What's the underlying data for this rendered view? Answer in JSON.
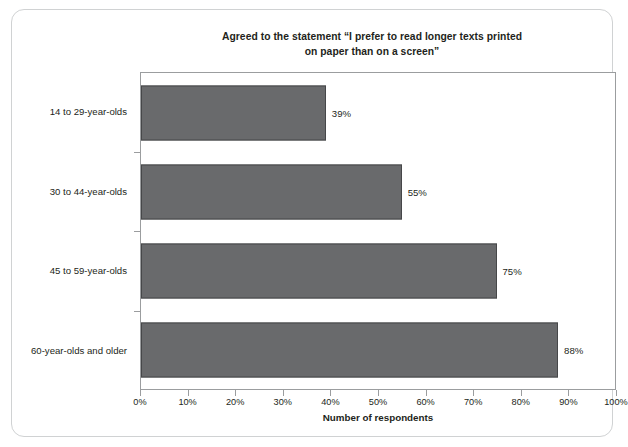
{
  "chart_data": {
    "type": "bar",
    "orientation": "horizontal",
    "title": "Agreed to the statement “I prefer to read longer texts printed on paper than on a screen”",
    "title_lines": [
      "Agreed to the statement “I prefer to read longer texts printed",
      "on paper than on a screen”"
    ],
    "categories": [
      "14 to 29-year-olds",
      "30 to 44-year-olds",
      "45 to 59-year-olds",
      "60-year-olds and older"
    ],
    "values": [
      39,
      55,
      75,
      88
    ],
    "value_labels": [
      "39%",
      "55%",
      "75%",
      "88%"
    ],
    "xlabel": "Number of respondents",
    "ylabel": "",
    "xlim": [
      0,
      100
    ],
    "xticks": [
      0,
      10,
      20,
      30,
      40,
      50,
      60,
      70,
      80,
      90,
      100
    ],
    "xtick_labels": [
      "0%",
      "10%",
      "20%",
      "30%",
      "40%",
      "50%",
      "60%",
      "70%",
      "80%",
      "90%",
      "100%"
    ],
    "grid": false,
    "legend": null,
    "bar_color": "#696a6c",
    "bar_border_color": "#464749",
    "axis_color": "#9b9d9f",
    "text_color": "#231f20",
    "frame_color": "#d0d2d3",
    "background": "#ffffff"
  }
}
